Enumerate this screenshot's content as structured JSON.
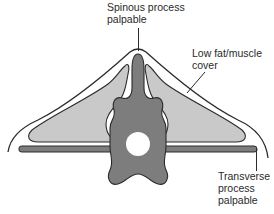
{
  "diagram": {
    "colors": {
      "background": "#ffffff",
      "outline": "#2b2b2b",
      "bone": "#7d7d7d",
      "muscle": "#c9c9c9",
      "canal": "#ffffff"
    },
    "labels": {
      "spinous": {
        "line1": "Spinous process",
        "line2": "palpable"
      },
      "lowfat": {
        "line1": "Low fat/muscle",
        "line2": "cover"
      },
      "transverse": {
        "line1": "Transverse",
        "line2": "process",
        "line3": "palpable"
      }
    },
    "parts": [
      "skin-outline",
      "muscle-left",
      "muscle-right",
      "transverse-process-bar",
      "vertebra",
      "spinal-canal"
    ]
  }
}
